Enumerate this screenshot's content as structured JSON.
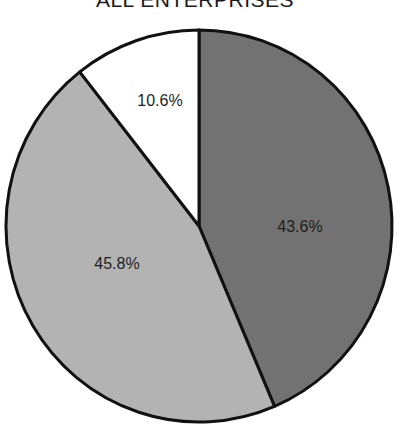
{
  "chart_data": {
    "type": "pie",
    "title": "ALL ENTERPRISES",
    "start_angle_deg": 0,
    "direction": "clockwise",
    "slices": [
      {
        "label": "43.6%",
        "value": 43.6,
        "color": "#727272"
      },
      {
        "label": "45.8%",
        "value": 45.8,
        "color": "#b3b3b3"
      },
      {
        "label": "10.6%",
        "value": 10.6,
        "color": "#ffffff"
      }
    ],
    "legend": "none"
  },
  "labels": {
    "title": "ALL ENTERPRISES",
    "slice_0": "43.6%",
    "slice_1": "45.8%",
    "slice_2": "10.6%"
  }
}
